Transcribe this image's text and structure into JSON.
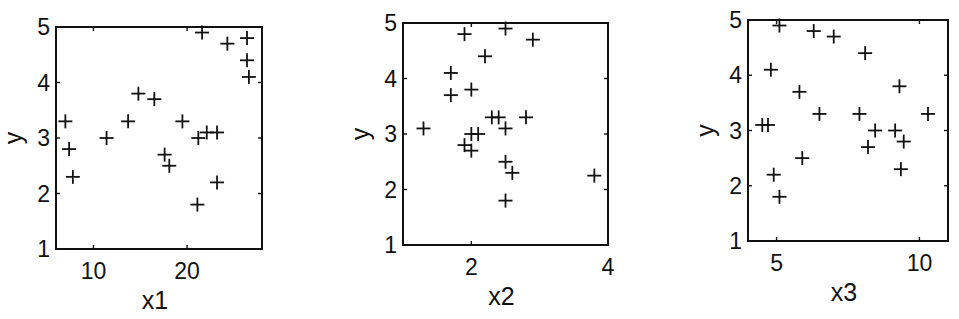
{
  "chart_data": [
    {
      "type": "scatter",
      "marker": "+",
      "xlabel": "x1",
      "ylabel": "y",
      "xlim": [
        6,
        28
      ],
      "ylim": [
        1,
        5
      ],
      "xticks": [
        10,
        20
      ],
      "yticks": [
        1,
        2,
        3,
        4,
        5
      ],
      "grid": false,
      "frame_px": {
        "left": 56,
        "right": 262,
        "top": 27,
        "bottom": 249
      },
      "points": [
        [
          7.0,
          3.3
        ],
        [
          7.4,
          2.8
        ],
        [
          7.8,
          2.3
        ],
        [
          11.4,
          3.0
        ],
        [
          13.7,
          3.3
        ],
        [
          14.8,
          3.8
        ],
        [
          16.5,
          3.7
        ],
        [
          17.6,
          2.7
        ],
        [
          18.1,
          2.5
        ],
        [
          19.5,
          3.3
        ],
        [
          21.1,
          1.8
        ],
        [
          21.2,
          3.0
        ],
        [
          21.6,
          4.9
        ],
        [
          22.1,
          3.1
        ],
        [
          23.2,
          3.1
        ],
        [
          23.2,
          2.2
        ],
        [
          24.3,
          4.7
        ],
        [
          26.4,
          4.8
        ],
        [
          26.4,
          4.4
        ],
        [
          26.6,
          4.1
        ]
      ]
    },
    {
      "type": "scatter",
      "marker": "+",
      "xlabel": "x2",
      "ylabel": "y",
      "xlim": [
        1,
        4
      ],
      "ylim": [
        1,
        5
      ],
      "xticks": [
        2,
        4
      ],
      "yticks": [
        1,
        2,
        3,
        4,
        5
      ],
      "grid": false,
      "frame_px": {
        "left": 403,
        "right": 608,
        "top": 23,
        "bottom": 245
      },
      "points": [
        [
          1.3,
          3.1
        ],
        [
          1.7,
          4.1
        ],
        [
          1.7,
          3.7
        ],
        [
          1.9,
          4.8
        ],
        [
          1.9,
          2.8
        ],
        [
          2.0,
          3.8
        ],
        [
          2.0,
          3.0
        ],
        [
          2.0,
          2.7
        ],
        [
          2.1,
          3.0
        ],
        [
          2.2,
          4.4
        ],
        [
          2.3,
          3.3
        ],
        [
          2.4,
          3.3
        ],
        [
          2.5,
          4.9
        ],
        [
          2.5,
          3.1
        ],
        [
          2.5,
          2.5
        ],
        [
          2.6,
          2.3
        ],
        [
          2.5,
          1.8
        ],
        [
          2.8,
          3.3
        ],
        [
          2.9,
          4.7
        ],
        [
          3.8,
          2.25
        ]
      ]
    },
    {
      "type": "scatter",
      "marker": "+",
      "xlabel": "x3",
      "ylabel": "y",
      "xlim": [
        4,
        11
      ],
      "ylim": [
        1,
        5
      ],
      "xticks": [
        5,
        10
      ],
      "yticks": [
        1,
        2,
        3,
        4,
        5
      ],
      "grid": false,
      "frame_px": {
        "left": 748,
        "right": 948,
        "top": 20,
        "bottom": 241
      },
      "points": [
        [
          4.5,
          3.1
        ],
        [
          4.7,
          3.1
        ],
        [
          4.8,
          4.1
        ],
        [
          4.9,
          2.2
        ],
        [
          5.1,
          4.9
        ],
        [
          5.1,
          1.8
        ],
        [
          5.8,
          3.7
        ],
        [
          5.9,
          2.5
        ],
        [
          6.3,
          4.8
        ],
        [
          6.5,
          3.3
        ],
        [
          7.0,
          4.7
        ],
        [
          7.9,
          3.3
        ],
        [
          8.1,
          4.4
        ],
        [
          8.2,
          2.7
        ],
        [
          8.45,
          3.0
        ],
        [
          9.15,
          3.0
        ],
        [
          9.3,
          3.8
        ],
        [
          9.45,
          2.8
        ],
        [
          9.35,
          2.3
        ],
        [
          10.3,
          3.3
        ]
      ]
    }
  ],
  "panels": [
    {
      "xlabel": "x1",
      "ylabel": "y",
      "xtick_labels": [
        "10",
        "20"
      ],
      "ytick_labels": [
        "1",
        "2",
        "3",
        "4",
        "5"
      ]
    },
    {
      "xlabel": "x2",
      "ylabel": "y",
      "xtick_labels": [
        "2",
        "4"
      ],
      "ytick_labels": [
        "1",
        "2",
        "3",
        "4",
        "5"
      ]
    },
    {
      "xlabel": "x3",
      "ylabel": "y",
      "xtick_labels": [
        "5",
        "10"
      ],
      "ytick_labels": [
        "1",
        "2",
        "3",
        "4",
        "5"
      ]
    }
  ]
}
